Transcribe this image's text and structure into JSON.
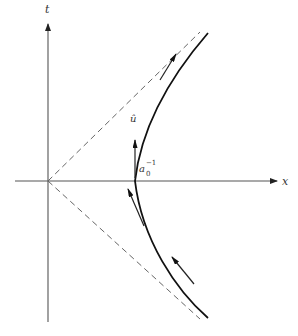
{
  "figure": {
    "axes": {
      "t_label": "t",
      "x_label": "x"
    },
    "labels": {
      "unit_vector": "û",
      "vertex_distance": "a",
      "vertex_sub": "0",
      "vertex_sup": "−1"
    },
    "colors": {
      "axis": "#555555",
      "curve": "#111111",
      "dashed": "#666666",
      "background": "#ffffff"
    }
  }
}
